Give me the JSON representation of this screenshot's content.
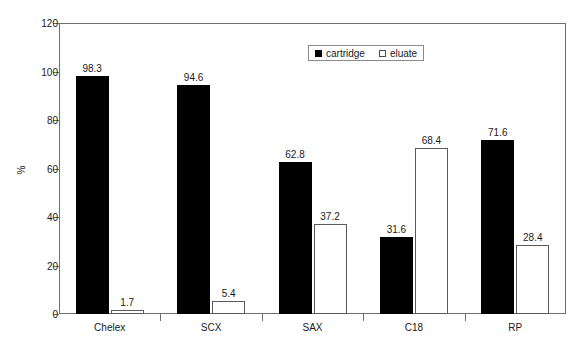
{
  "chart_data": {
    "type": "bar",
    "title": "",
    "subtitle": "",
    "xlabel": "",
    "ylabel": "%",
    "ylim": [
      0,
      120
    ],
    "yticks": [
      0,
      20,
      40,
      60,
      80,
      100,
      120
    ],
    "ytick_labels": [
      "0",
      "20",
      "40",
      "60",
      "80",
      "100",
      "120"
    ],
    "grid": false,
    "legend_position": "top-center-right",
    "categories": [
      "Chelex",
      "SCX",
      "SAX",
      "C18",
      "RP"
    ],
    "series": [
      {
        "name": "cartridge",
        "color": "#000000",
        "style": "filled",
        "values": [
          98.3,
          94.6,
          62.8,
          31.6,
          71.6
        ],
        "labels": [
          "98.3",
          "94.6",
          "62.8",
          "31.6",
          "71.6"
        ]
      },
      {
        "name": "eluate",
        "color": "#ffffff",
        "style": "hollow",
        "values": [
          1.7,
          5.4,
          37.2,
          68.4,
          28.4
        ],
        "labels": [
          "1.7",
          "5.4",
          "37.2",
          "68.4",
          "28.4"
        ]
      }
    ]
  },
  "legend": {
    "entries": [
      {
        "label": "cartridge",
        "swatch": "filled-square-icon"
      },
      {
        "label": "eluate",
        "swatch": "hollow-square-icon"
      }
    ]
  },
  "axes": {
    "y_title": "%",
    "y_tick_labels": [
      "120",
      "100",
      "80",
      "60",
      "40",
      "20",
      "0"
    ],
    "x_tick_labels": [
      "Chelex",
      "SCX",
      "SAX",
      "C18",
      "RP"
    ]
  },
  "colors": {
    "cartridge": "#000000",
    "eluate": "#ffffff",
    "axis": "#6e6e6e",
    "text": "#1a1a1a",
    "background": "#ffffff"
  }
}
